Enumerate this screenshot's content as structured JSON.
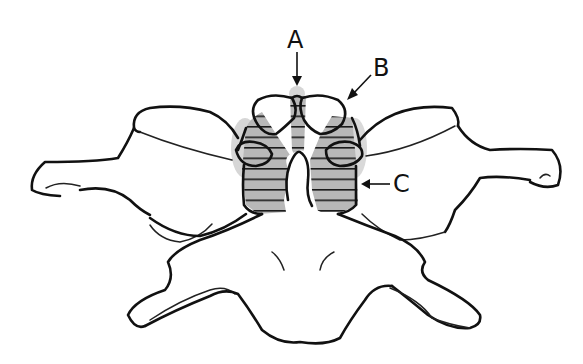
{
  "figure": {
    "labels": [
      {
        "id": "A",
        "text": "A",
        "x": 287,
        "y": 28,
        "arrow": "down"
      },
      {
        "id": "B",
        "text": "B",
        "x": 373,
        "y": 58,
        "arrow": "down-left"
      },
      {
        "id": "C",
        "text": "C",
        "x": 383,
        "y": 172,
        "arrow": "left"
      }
    ],
    "colors": {
      "line": "#111111",
      "hatch_fill": "#b5b5b5",
      "shadow": "#cfcfcf",
      "background": "#ffffff"
    }
  }
}
